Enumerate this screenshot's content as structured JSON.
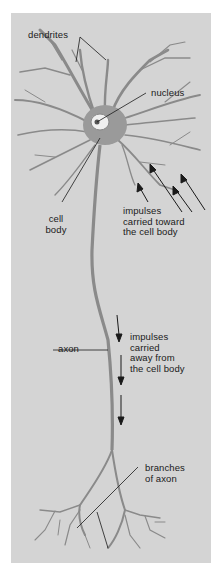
{
  "diagram": {
    "colors": {
      "background": "#d4d4d4",
      "page": "#ffffff",
      "ink": "#1a1a1a",
      "neuron": "#8a8a8a",
      "highlight": "#f0f0f0"
    },
    "labels": {
      "dendrites": "dendrites",
      "nucleus": "nucleus",
      "cell_body": {
        "line1": "cell",
        "line2": "body"
      },
      "impulses_toward": {
        "line1": "impulses",
        "line2": "carried toward",
        "line3": "the cell body"
      },
      "axon": "axon",
      "impulses_away": {
        "line1": "impulses",
        "line2": "carried",
        "line3": "away from",
        "line4": "the cell body"
      },
      "branches": {
        "line1": "branches",
        "line2": "of axon"
      }
    },
    "arrows": {
      "toward_cell_body_count": 4,
      "away_from_cell_body_count": 3
    }
  }
}
